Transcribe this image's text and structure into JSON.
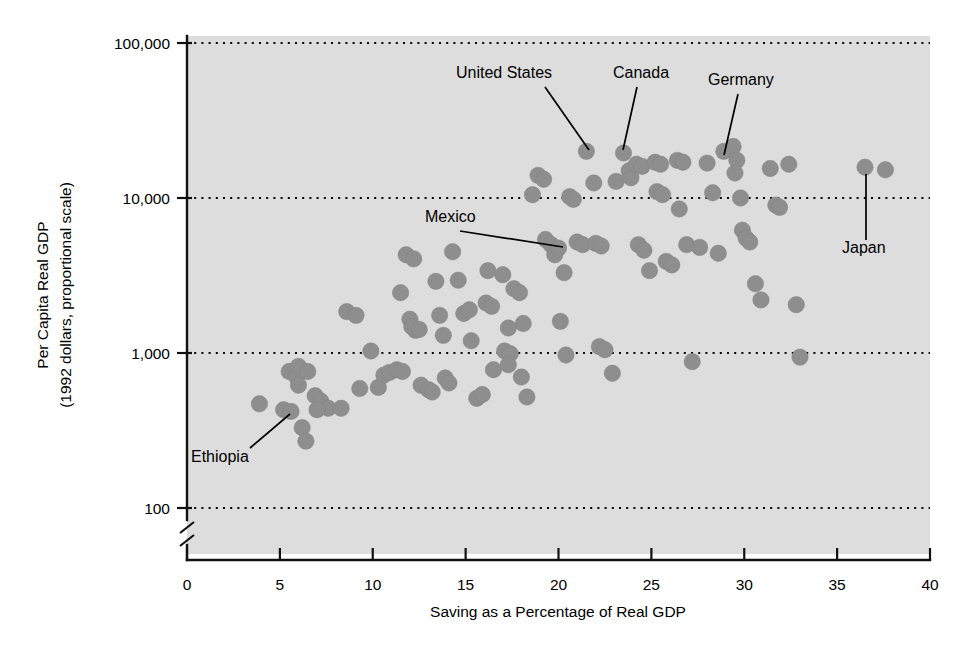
{
  "chart_data": {
    "type": "scatter",
    "title": "",
    "xlabel": "Saving as a Percentage of Real GDP",
    "ylabel": "Per Capita Real GDP\n(1992 dollars, proportional scale)",
    "ylabel_line1": "Per Capita Real GDP",
    "ylabel_line2": "(1992 dollars, proportional scale)",
    "xlim": [
      0,
      40
    ],
    "ylim": [
      100,
      100000
    ],
    "yscale": "log",
    "y_axis_break": true,
    "grid": "horizontal-dotted",
    "legend": "none",
    "xticks": [
      0,
      5,
      10,
      15,
      20,
      25,
      30,
      35,
      40
    ],
    "xticklabels": [
      "0",
      "5",
      "10",
      "15",
      "20",
      "25",
      "30",
      "35",
      "40"
    ],
    "yticks": [
      100,
      1000,
      10000,
      100000
    ],
    "yticklabels": [
      "100",
      "1,000",
      "10,000",
      "100,000"
    ],
    "marker_color": "#8e8e8e",
    "plot_background": "#dddddd",
    "points": [
      {
        "x": 3.9,
        "y": 470
      },
      {
        "x": 5.2,
        "y": 430
      },
      {
        "x": 5.6,
        "y": 420
      },
      {
        "x": 5.5,
        "y": 760
      },
      {
        "x": 5.9,
        "y": 700
      },
      {
        "x": 6.0,
        "y": 820
      },
      {
        "x": 6.5,
        "y": 760
      },
      {
        "x": 6.0,
        "y": 620
      },
      {
        "x": 6.2,
        "y": 330
      },
      {
        "x": 6.4,
        "y": 270
      },
      {
        "x": 6.9,
        "y": 530
      },
      {
        "x": 7.2,
        "y": 490
      },
      {
        "x": 7.6,
        "y": 440
      },
      {
        "x": 7.0,
        "y": 430
      },
      {
        "x": 8.3,
        "y": 440
      },
      {
        "x": 8.6,
        "y": 1850
      },
      {
        "x": 9.1,
        "y": 1750
      },
      {
        "x": 9.3,
        "y": 590
      },
      {
        "x": 9.9,
        "y": 1030
      },
      {
        "x": 10.3,
        "y": 600
      },
      {
        "x": 10.6,
        "y": 720
      },
      {
        "x": 10.9,
        "y": 750
      },
      {
        "x": 11.3,
        "y": 780
      },
      {
        "x": 11.6,
        "y": 760
      },
      {
        "x": 11.5,
        "y": 2450
      },
      {
        "x": 11.8,
        "y": 4300
      },
      {
        "x": 12.2,
        "y": 4050
      },
      {
        "x": 12.0,
        "y": 1650
      },
      {
        "x": 12.3,
        "y": 1400
      },
      {
        "x": 12.1,
        "y": 1480
      },
      {
        "x": 12.5,
        "y": 1420
      },
      {
        "x": 12.6,
        "y": 620
      },
      {
        "x": 13.0,
        "y": 580
      },
      {
        "x": 13.2,
        "y": 560
      },
      {
        "x": 13.4,
        "y": 2900
      },
      {
        "x": 13.6,
        "y": 1750
      },
      {
        "x": 13.8,
        "y": 1300
      },
      {
        "x": 13.9,
        "y": 690
      },
      {
        "x": 14.1,
        "y": 640
      },
      {
        "x": 14.3,
        "y": 4500
      },
      {
        "x": 14.6,
        "y": 2950
      },
      {
        "x": 14.9,
        "y": 1800
      },
      {
        "x": 15.2,
        "y": 1900
      },
      {
        "x": 15.3,
        "y": 1200
      },
      {
        "x": 15.6,
        "y": 510
      },
      {
        "x": 15.9,
        "y": 540
      },
      {
        "x": 16.2,
        "y": 3400
      },
      {
        "x": 16.1,
        "y": 2100
      },
      {
        "x": 16.4,
        "y": 2000
      },
      {
        "x": 16.5,
        "y": 780
      },
      {
        "x": 17.0,
        "y": 3200
      },
      {
        "x": 17.3,
        "y": 1450
      },
      {
        "x": 17.1,
        "y": 1030
      },
      {
        "x": 17.4,
        "y": 990
      },
      {
        "x": 17.3,
        "y": 840
      },
      {
        "x": 17.6,
        "y": 2600
      },
      {
        "x": 17.9,
        "y": 2450
      },
      {
        "x": 18.1,
        "y": 1550
      },
      {
        "x": 18.0,
        "y": 700
      },
      {
        "x": 18.3,
        "y": 520
      },
      {
        "x": 18.6,
        "y": 10500
      },
      {
        "x": 18.9,
        "y": 14000
      },
      {
        "x": 19.2,
        "y": 13200
      },
      {
        "x": 19.3,
        "y": 5400
      },
      {
        "x": 19.6,
        "y": 5000
      },
      {
        "x": 19.8,
        "y": 4300
      },
      {
        "x": 20.0,
        "y": 4750
      },
      {
        "x": 20.3,
        "y": 3300
      },
      {
        "x": 20.1,
        "y": 1600
      },
      {
        "x": 20.4,
        "y": 970
      },
      {
        "x": 20.6,
        "y": 10200
      },
      {
        "x": 20.8,
        "y": 9800
      },
      {
        "x": 21.0,
        "y": 5200
      },
      {
        "x": 21.3,
        "y": 5000
      },
      {
        "x": 21.5,
        "y": 20000
      },
      {
        "x": 21.9,
        "y": 12500
      },
      {
        "x": 22.0,
        "y": 5100
      },
      {
        "x": 22.3,
        "y": 4900
      },
      {
        "x": 22.2,
        "y": 1100
      },
      {
        "x": 22.5,
        "y": 1050
      },
      {
        "x": 22.9,
        "y": 740
      },
      {
        "x": 23.1,
        "y": 12800
      },
      {
        "x": 23.5,
        "y": 19500
      },
      {
        "x": 23.8,
        "y": 15000
      },
      {
        "x": 23.9,
        "y": 13500
      },
      {
        "x": 24.2,
        "y": 16500
      },
      {
        "x": 24.5,
        "y": 16000
      },
      {
        "x": 24.3,
        "y": 5000
      },
      {
        "x": 24.6,
        "y": 4600
      },
      {
        "x": 24.9,
        "y": 3400
      },
      {
        "x": 25.2,
        "y": 17000
      },
      {
        "x": 25.5,
        "y": 16500
      },
      {
        "x": 25.3,
        "y": 11000
      },
      {
        "x": 25.6,
        "y": 10500
      },
      {
        "x": 25.8,
        "y": 3900
      },
      {
        "x": 26.1,
        "y": 3700
      },
      {
        "x": 26.4,
        "y": 17500
      },
      {
        "x": 26.7,
        "y": 17000
      },
      {
        "x": 26.5,
        "y": 8500
      },
      {
        "x": 26.9,
        "y": 5000
      },
      {
        "x": 27.2,
        "y": 880
      },
      {
        "x": 27.6,
        "y": 4800
      },
      {
        "x": 28.0,
        "y": 16800
      },
      {
        "x": 28.3,
        "y": 10800
      },
      {
        "x": 28.6,
        "y": 4400
      },
      {
        "x": 28.9,
        "y": 20000
      },
      {
        "x": 29.4,
        "y": 21500
      },
      {
        "x": 29.6,
        "y": 17500
      },
      {
        "x": 29.5,
        "y": 14500
      },
      {
        "x": 29.8,
        "y": 10000
      },
      {
        "x": 29.9,
        "y": 6200
      },
      {
        "x": 30.1,
        "y": 5500
      },
      {
        "x": 30.3,
        "y": 5200
      },
      {
        "x": 30.6,
        "y": 2800
      },
      {
        "x": 30.9,
        "y": 2200
      },
      {
        "x": 31.4,
        "y": 15500
      },
      {
        "x": 31.7,
        "y": 9000
      },
      {
        "x": 31.9,
        "y": 8700
      },
      {
        "x": 32.4,
        "y": 16500
      },
      {
        "x": 32.8,
        "y": 2050
      },
      {
        "x": 33.0,
        "y": 940
      },
      {
        "x": 36.5,
        "y": 15800
      },
      {
        "x": 37.6,
        "y": 15200
      }
    ],
    "annotations": [
      {
        "label": "United States",
        "label_x": 456,
        "label_y": 78,
        "anchor": "start",
        "line": [
          [
            545,
            87
          ],
          [
            589,
            150
          ]
        ],
        "point": {
          "x": 21.5,
          "y": 20000
        }
      },
      {
        "label": "Canada",
        "label_x": 613,
        "label_y": 78,
        "anchor": "start",
        "line": [
          [
            637,
            87
          ],
          [
            623,
            150
          ]
        ],
        "point": {
          "x": 23.5,
          "y": 19500
        }
      },
      {
        "label": "Germany",
        "label_x": 708,
        "label_y": 85,
        "anchor": "start",
        "line": [
          [
            738,
            94
          ],
          [
            724,
            155
          ]
        ],
        "point": {
          "x": 28.9,
          "y": 20000
        }
      },
      {
        "label": "Mexico",
        "label_x": 425,
        "label_y": 222,
        "anchor": "start",
        "line": [
          [
            460,
            231
          ],
          [
            563,
            247
          ]
        ],
        "point": {
          "x": 20.0,
          "y": 4750
        }
      },
      {
        "label": "Japan",
        "label_x": 842,
        "label_y": 253,
        "anchor": "start",
        "line": [
          [
            866,
            240
          ],
          [
            866,
            174
          ]
        ],
        "point": {
          "x": 36.5,
          "y": 15800
        }
      },
      {
        "label": "Ethiopia",
        "label_x": 191,
        "label_y": 462,
        "anchor": "start",
        "line": [
          [
            250,
            448
          ],
          [
            290,
            414
          ]
        ],
        "point": {
          "x": 5.6,
          "y": 420
        }
      }
    ]
  },
  "axes": {
    "x_title": "Saving as a Percentage of Real GDP",
    "y_title_line1": "Per Capita Real GDP",
    "y_title_line2": "(1992 dollars, proportional scale)"
  }
}
